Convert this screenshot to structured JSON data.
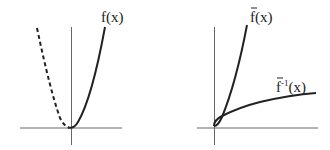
{
  "left_plot": {
    "curve_label": "f(x)",
    "solid_curve": "f(x) for x >= 0",
    "dashed_curve": "f(x) for x < 0 (mirror, dashed)"
  },
  "right_plot": {
    "curve_label_main": "f",
    "curve_label_main_suffix": "(x)",
    "curve_label_inverse": "f",
    "curve_label_inverse_sup": "-1",
    "curve_label_inverse_suffix": "(x)"
  },
  "colors": {
    "axis": "#555555",
    "curve": "#222222",
    "background": "#ffffff"
  }
}
